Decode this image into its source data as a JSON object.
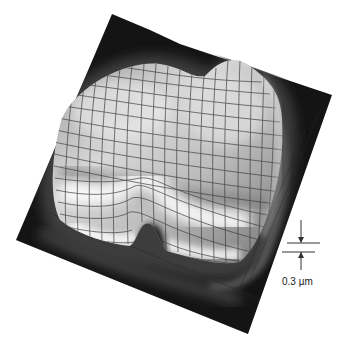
{
  "figure": {
    "plate_color": "#111111",
    "surface_highlight": "#f2f2f2",
    "mesh_color": "#3a3a3a"
  },
  "scale_bar": {
    "label": "0.3 µm"
  }
}
